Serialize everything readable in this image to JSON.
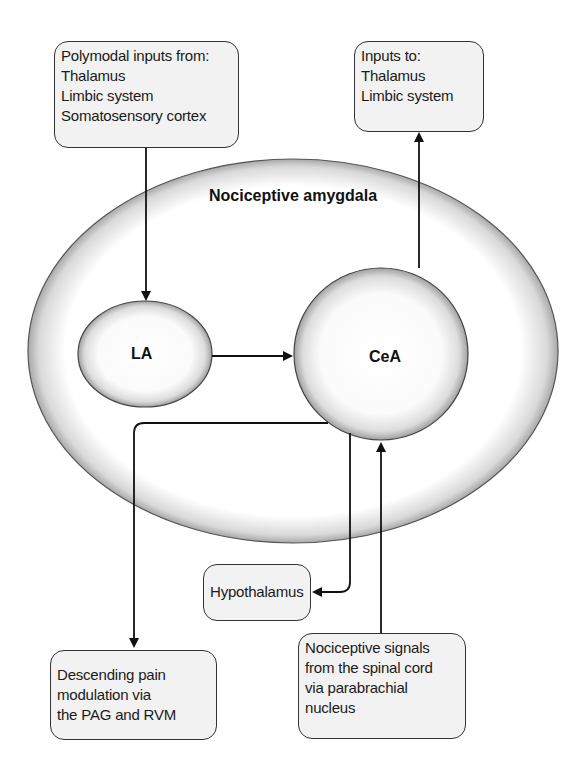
{
  "diagram": {
    "title": "Nociceptive amygdala",
    "nodes": {
      "la": {
        "label": "LA"
      },
      "cea": {
        "label": "CeA"
      }
    },
    "boxes": {
      "polymodal_inputs": {
        "lines": [
          "Polymodal inputs from:",
          "Thalamus",
          "Limbic system",
          "Somatosensory cortex"
        ]
      },
      "outputs": {
        "lines": [
          "Inputs to:",
          "Thalamus",
          "Limbic system"
        ]
      },
      "hypothalamus": {
        "lines": [
          "Hypothalamus"
        ]
      },
      "descending": {
        "lines": [
          "Descending pain",
          "modulation via",
          "the PAG and RVM"
        ]
      },
      "nociceptive_signals": {
        "lines": [
          "Nociceptive signals",
          "from the spinal cord",
          "via parabrachial",
          "nucleus"
        ]
      }
    },
    "edges": [
      {
        "from": "Polymodal inputs",
        "to": "LA"
      },
      {
        "from": "LA",
        "to": "CeA"
      },
      {
        "from": "CeA",
        "to": "Inputs to: Thalamus, Limbic system"
      },
      {
        "from": "CeA",
        "to": "Descending pain modulation"
      },
      {
        "from": "CeA",
        "to": "Hypothalamus"
      },
      {
        "from": "Nociceptive signals",
        "to": "CeA"
      }
    ],
    "colors": {
      "line": "#111111",
      "box_fill": "#f2f2f2",
      "ellipse_edge": "#9a9a9a"
    }
  }
}
